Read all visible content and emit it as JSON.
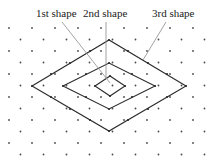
{
  "figure": {
    "background_color": "#ffffff",
    "width": 213,
    "height": 166
  },
  "labels": [
    {
      "id": "first-shape",
      "text": "1st shape",
      "x": 36,
      "y": 14,
      "anchor": "start",
      "leader": {
        "x1": 62,
        "y1": 22,
        "x2": 110,
        "y2": 83
      }
    },
    {
      "id": "second-shape",
      "text": "2nd shape",
      "x": 83,
      "y": 14,
      "anchor": "start",
      "leader": {
        "x1": 106,
        "y1": 22,
        "x2": 106,
        "y2": 79
      }
    },
    {
      "id": "third-shape",
      "text": "3rd shape",
      "x": 152,
      "y": 14,
      "anchor": "start",
      "leader": {
        "x1": 166,
        "y1": 22,
        "x2": 143,
        "y2": 60
      }
    }
  ],
  "shapes": [
    {
      "id": "shape-1-inner",
      "name": "1st shape",
      "order": 1,
      "center": {
        "x": 110,
        "y": 86
      },
      "half_width": 15,
      "half_height": 10,
      "points": "95,86 110,76 125,86 110,96",
      "vertex_dots": [
        {
          "x": 95,
          "y": 86
        },
        {
          "x": 110,
          "y": 76
        },
        {
          "x": 125,
          "y": 86
        },
        {
          "x": 110,
          "y": 96
        }
      ]
    },
    {
      "id": "shape-2-middle",
      "name": "2nd shape",
      "order": 2,
      "center": {
        "x": 109,
        "y": 86
      },
      "half_width": 46,
      "half_height": 23,
      "points": "63,86 109,63 155,86 109,109",
      "vertex_dots": [
        {
          "x": 63,
          "y": 86
        },
        {
          "x": 86,
          "y": 74
        },
        {
          "x": 109,
          "y": 63
        },
        {
          "x": 132,
          "y": 74
        },
        {
          "x": 155,
          "y": 86
        },
        {
          "x": 132,
          "y": 97
        },
        {
          "x": 109,
          "y": 109
        },
        {
          "x": 86,
          "y": 97
        }
      ]
    },
    {
      "id": "shape-3-outer",
      "name": "3rd shape",
      "order": 3,
      "center": {
        "x": 109,
        "y": 86
      },
      "half_width": 77,
      "half_height": 46,
      "points": "32,86 109,40 186,86 109,131",
      "vertex_dots": [
        {
          "x": 32,
          "y": 86
        },
        {
          "x": 51,
          "y": 74
        },
        {
          "x": 70,
          "y": 63
        },
        {
          "x": 90,
          "y": 51
        },
        {
          "x": 109,
          "y": 40
        },
        {
          "x": 128,
          "y": 51
        },
        {
          "x": 148,
          "y": 63
        },
        {
          "x": 167,
          "y": 74
        },
        {
          "x": 186,
          "y": 86
        },
        {
          "x": 167,
          "y": 97
        },
        {
          "x": 148,
          "y": 109
        },
        {
          "x": 128,
          "y": 120
        },
        {
          "x": 109,
          "y": 131
        },
        {
          "x": 90,
          "y": 120
        },
        {
          "x": 70,
          "y": 109
        },
        {
          "x": 51,
          "y": 97
        }
      ]
    }
  ],
  "dot_grid": {
    "description": "staggered lattice of small dots",
    "spacing_x": 23,
    "spacing_y": 11.5,
    "row_offset_x": 11.5,
    "radius": 0.9,
    "color": "#4a4a4a",
    "origin": {
      "x": 9,
      "y": 28
    },
    "columns": 10,
    "rows": 12
  },
  "colors": {
    "stroke": "#2b2b2b",
    "leader": "#8a8a8a",
    "dot": "#4a4a4a",
    "text": "#1a1a1a",
    "background": "#ffffff"
  }
}
